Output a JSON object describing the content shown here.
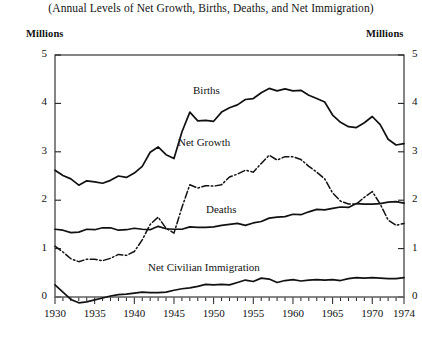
{
  "chart_title": "(Annual Levels of Net Growth, Births, Deaths, and Net Immigration)",
  "axis": {
    "left_unit": "Millions",
    "right_unit": "Millions",
    "y_ticks": [
      "0",
      "1",
      "2",
      "3",
      "4",
      "5"
    ],
    "x_ticks": [
      "1930",
      "1935",
      "1940",
      "1945",
      "1950",
      "1955",
      "1960",
      "1965",
      "1970",
      "1974"
    ]
  },
  "labels": {
    "births": "Births",
    "net_growth": "Net Growth",
    "deaths": "Deaths",
    "immigration": "Net Civilian Immigration"
  },
  "colors": {
    "line": "#111111",
    "axis": "#333333",
    "background": "#ffffff"
  },
  "chart_data": {
    "type": "line",
    "title": "(Annual Levels of Net Growth, Births, Deaths, and Net Immigration)",
    "xlabel": "",
    "ylabel": "Millions",
    "xlim": [
      1930,
      1974
    ],
    "ylim": [
      0,
      5
    ],
    "y_unit": "Millions",
    "grid": false,
    "legend": "inline-labels",
    "x": [
      1930,
      1931,
      1932,
      1933,
      1934,
      1935,
      1936,
      1937,
      1938,
      1939,
      1940,
      1941,
      1942,
      1943,
      1944,
      1945,
      1946,
      1947,
      1948,
      1949,
      1950,
      1951,
      1952,
      1953,
      1954,
      1955,
      1956,
      1957,
      1958,
      1959,
      1960,
      1961,
      1962,
      1963,
      1964,
      1965,
      1966,
      1967,
      1968,
      1969,
      1970,
      1971,
      1972,
      1973,
      1974
    ],
    "series": [
      {
        "name": "Births",
        "style": "solid",
        "values": [
          2.62,
          2.51,
          2.44,
          2.31,
          2.4,
          2.38,
          2.35,
          2.41,
          2.5,
          2.47,
          2.56,
          2.7,
          2.99,
          3.1,
          2.94,
          2.86,
          3.41,
          3.82,
          3.64,
          3.65,
          3.63,
          3.82,
          3.91,
          3.97,
          4.08,
          4.1,
          4.22,
          4.31,
          4.26,
          4.3,
          4.26,
          4.27,
          4.17,
          4.1,
          4.03,
          3.76,
          3.61,
          3.52,
          3.5,
          3.6,
          3.73,
          3.56,
          3.26,
          3.14,
          3.17
        ]
      },
      {
        "name": "Net Growth",
        "style": "dash-dot",
        "values": [
          1.05,
          0.93,
          0.79,
          0.73,
          0.78,
          0.78,
          0.75,
          0.8,
          0.88,
          0.86,
          0.94,
          1.18,
          1.5,
          1.65,
          1.42,
          1.32,
          1.85,
          2.32,
          2.25,
          2.3,
          2.29,
          2.32,
          2.48,
          2.54,
          2.62,
          2.58,
          2.76,
          2.93,
          2.83,
          2.9,
          2.9,
          2.84,
          2.7,
          2.58,
          2.44,
          2.15,
          1.98,
          1.92,
          1.92,
          2.06,
          2.18,
          1.92,
          1.59,
          1.48,
          1.52
        ]
      },
      {
        "name": "Deaths",
        "style": "solid",
        "values": [
          1.4,
          1.38,
          1.33,
          1.34,
          1.4,
          1.39,
          1.43,
          1.43,
          1.38,
          1.39,
          1.42,
          1.4,
          1.39,
          1.46,
          1.41,
          1.4,
          1.4,
          1.45,
          1.44,
          1.44,
          1.45,
          1.48,
          1.5,
          1.52,
          1.48,
          1.53,
          1.56,
          1.63,
          1.65,
          1.66,
          1.71,
          1.7,
          1.76,
          1.81,
          1.8,
          1.83,
          1.86,
          1.85,
          1.93,
          1.92,
          1.92,
          1.93,
          1.96,
          1.97,
          1.94
        ]
      },
      {
        "name": "Net Civilian Immigration",
        "style": "solid",
        "values": [
          0.25,
          0.1,
          -0.05,
          -0.12,
          -0.1,
          -0.06,
          -0.02,
          0.02,
          0.05,
          0.06,
          0.08,
          0.1,
          0.09,
          0.09,
          0.1,
          0.14,
          0.17,
          0.19,
          0.22,
          0.26,
          0.25,
          0.26,
          0.25,
          0.3,
          0.35,
          0.32,
          0.39,
          0.37,
          0.3,
          0.34,
          0.36,
          0.33,
          0.35,
          0.36,
          0.35,
          0.36,
          0.34,
          0.38,
          0.4,
          0.39,
          0.4,
          0.39,
          0.38,
          0.38,
          0.4
        ]
      }
    ]
  }
}
